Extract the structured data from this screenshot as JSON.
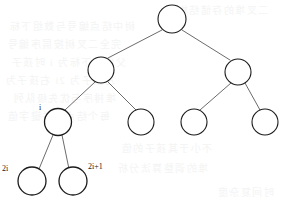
{
  "figure": {
    "type": "binary-heap-tree-diagram",
    "width": 286,
    "height": 203,
    "background_color": "#ffffff",
    "edge_color": "#5a5a5a",
    "node_stroke_color": "#1b1b1b",
    "node_fill_color": "#ffffff",
    "label_color": "#1b1b1b",
    "ghost_text_color": "#f4f4f4"
  },
  "tree": {
    "levels": 4,
    "node_count": 9,
    "nodes": [
      {
        "id": "root",
        "level": 0,
        "cx": 172,
        "cy": 19,
        "r": 14,
        "stroke_width": 1.1,
        "label": ""
      },
      {
        "id": "level2-left",
        "level": 1,
        "cx": 101,
        "cy": 70,
        "r": 13,
        "stroke_width": 1.1,
        "label": ""
      },
      {
        "id": "level2-right",
        "level": 1,
        "cx": 238,
        "cy": 72,
        "r": 13,
        "stroke_width": 1.1,
        "label": ""
      },
      {
        "id": "node-i",
        "level": 2,
        "cx": 58,
        "cy": 122,
        "r": 13.5,
        "stroke_width": 1.3,
        "label": "i"
      },
      {
        "id": "level3-b",
        "level": 2,
        "cx": 141,
        "cy": 122,
        "r": 13,
        "stroke_width": 1.1,
        "label": ""
      },
      {
        "id": "level3-c",
        "level": 2,
        "cx": 194,
        "cy": 122,
        "r": 13,
        "stroke_width": 1.1,
        "label": ""
      },
      {
        "id": "level3-d",
        "level": 2,
        "cx": 265,
        "cy": 122,
        "r": 13,
        "stroke_width": 1.1,
        "label": ""
      },
      {
        "id": "node-2i",
        "level": 3,
        "cx": 32,
        "cy": 181,
        "r": 14,
        "stroke_width": 1.3,
        "label": "2i"
      },
      {
        "id": "node-2i1",
        "level": 3,
        "cx": 73,
        "cy": 181,
        "r": 14,
        "stroke_width": 1.3,
        "label": "2i+1"
      }
    ],
    "edges": [
      {
        "id": "edge-root-left",
        "from": "root",
        "to": "level2-left",
        "x1": 162,
        "y1": 30,
        "x2": 108,
        "y2": 58
      },
      {
        "id": "edge-root-right",
        "from": "root",
        "to": "level2-right",
        "x1": 182,
        "y1": 30,
        "x2": 230,
        "y2": 60
      },
      {
        "id": "edge-l2l-i",
        "from": "level2-left",
        "to": "node-i",
        "x1": 95,
        "y1": 82,
        "x2": 65,
        "y2": 110
      },
      {
        "id": "edge-l2l-b",
        "from": "level2-left",
        "to": "level3-b",
        "x1": 108,
        "y1": 82,
        "x2": 136,
        "y2": 110
      },
      {
        "id": "edge-l2r-c",
        "from": "level2-right",
        "to": "level3-c",
        "x1": 231,
        "y1": 83,
        "x2": 200,
        "y2": 110
      },
      {
        "id": "edge-l2r-d",
        "from": "level2-right",
        "to": "level3-d",
        "x1": 245,
        "y1": 83,
        "x2": 260,
        "y2": 110
      },
      {
        "id": "edge-i-2i",
        "from": "node-i",
        "to": "node-2i",
        "x1": 53,
        "y1": 135,
        "x2": 39,
        "y2": 169
      },
      {
        "id": "edge-i-2i1",
        "from": "node-i",
        "to": "node-2i1",
        "x1": 62,
        "y1": 135,
        "x2": 69,
        "y2": 169
      }
    ]
  },
  "labels": [
    {
      "id": "label-i",
      "text": "i",
      "x": 39,
      "y": 104,
      "font_size": 8
    },
    {
      "id": "label-2i",
      "text": "2i",
      "x": 2,
      "y": 165,
      "font_size": 8
    },
    {
      "id": "label-2i1",
      "text": "2i+1",
      "x": 88,
      "y": 163,
      "font_size": 8
    }
  ],
  "ghost_text": {
    "description": "faint reverse-side bleed-through from scanned page, illegible",
    "lines": [
      {
        "id": "ghost-1",
        "text": "二叉堆的存储结构",
        "x": 176,
        "y": 2
      },
      {
        "id": "ghost-2",
        "text": "树中结点编号与数组下标",
        "x": 8,
        "y": 18
      },
      {
        "id": "ghost-3",
        "text": "完全二叉树按层序编号",
        "x": 6,
        "y": 36
      },
      {
        "id": "ghost-4",
        "text": "父结点下标为 i 时孩子",
        "x": 10,
        "y": 54
      },
      {
        "id": "ghost-5",
        "text": "左孩子为 2i 右孩子为",
        "x": 4,
        "y": 72
      },
      {
        "id": "ghost-6",
        "text": "堆排序与优先级队列",
        "x": 12,
        "y": 90
      },
      {
        "id": "ghost-7",
        "text": "每个结点的关键字值",
        "x": 6,
        "y": 108
      },
      {
        "id": "ghost-8",
        "text": "不小于其孩子的值",
        "x": 120,
        "y": 140
      },
      {
        "id": "ghost-9",
        "text": "堆的调整算法分析",
        "x": 116,
        "y": 160
      },
      {
        "id": "ghost-10",
        "text": "时间复杂度",
        "x": 216,
        "y": 184
      }
    ]
  }
}
